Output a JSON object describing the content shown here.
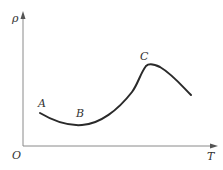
{
  "diagram": {
    "type": "line-graph",
    "axes": {
      "y_label": "ρ",
      "x_label": "T",
      "origin_label": "O"
    },
    "points": [
      {
        "label": "A"
      },
      {
        "label": "B"
      },
      {
        "label": "C"
      }
    ],
    "colors": {
      "axis": "#8a8a8a",
      "curve": "#2a2a2a",
      "text": "#333333"
    }
  }
}
